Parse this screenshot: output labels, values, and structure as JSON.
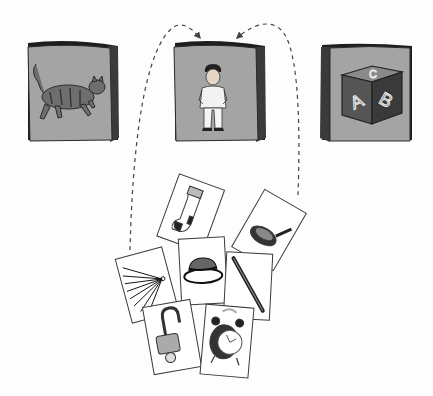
{
  "figure": {
    "colors": {
      "background": "#fdfdfd",
      "bag_face": "#a4a4a4",
      "bag_side": "#3a3a3a",
      "bag_top": "#1e1e1e",
      "card_fill": "#ffffff",
      "card_stroke": "#3a3a3a",
      "arrow": "#444444"
    }
  },
  "bags": [
    {
      "id": "left",
      "picture": "cat-icon"
    },
    {
      "id": "middle",
      "picture": "man-icon"
    },
    {
      "id": "right",
      "picture": "abc-block-icon",
      "block_letters": [
        "A",
        "B",
        "C"
      ]
    }
  ],
  "cards": [
    {
      "picture": "sock-icon"
    },
    {
      "picture": "frying-pan-icon"
    },
    {
      "picture": "hand-fan-icon"
    },
    {
      "picture": "hat-icon"
    },
    {
      "picture": "stick-icon"
    },
    {
      "picture": "padlock-icon"
    },
    {
      "picture": "alarm-clock-icon"
    }
  ],
  "arrows": [
    {
      "from": "cards",
      "to": "middle-bag",
      "style": "dashed"
    },
    {
      "from": "cards",
      "to": "middle-bag",
      "style": "dashed"
    }
  ]
}
